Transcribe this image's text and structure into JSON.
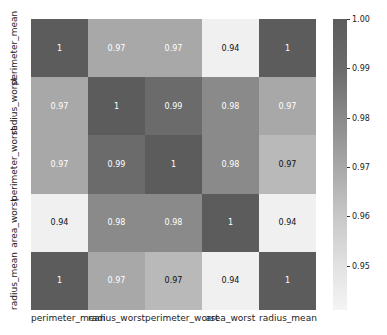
{
  "chart_data": {
    "type": "heatmap",
    "title": "",
    "xlabel": "",
    "ylabel": "",
    "x_labels": [
      "perimeter_mean",
      "radius_worst",
      "perimeter_worst",
      "area_worst",
      "radius_mean"
    ],
    "y_labels": [
      "perimeter_mean",
      "radius_worst",
      "perimeter_worst",
      "area_worst",
      "radius_mean"
    ],
    "matrix": [
      [
        1,
        0.97,
        0.97,
        0.94,
        1
      ],
      [
        0.97,
        1,
        0.99,
        0.98,
        0.97
      ],
      [
        0.97,
        0.99,
        1,
        0.98,
        0.97
      ],
      [
        0.94,
        0.98,
        0.98,
        1,
        0.94
      ],
      [
        1,
        0.97,
        0.97,
        0.94,
        1
      ]
    ],
    "annotations": [
      [
        "1",
        "0.97",
        "0.97",
        "0.94",
        "1"
      ],
      [
        "0.97",
        "1",
        "0.99",
        "0.98",
        "0.97"
      ],
      [
        "0.97",
        "0.99",
        "1",
        "0.98",
        "0.97"
      ],
      [
        "0.94",
        "0.98",
        "0.98",
        "1",
        "0.94"
      ],
      [
        "1",
        "0.97",
        "0.97",
        "0.94",
        "1"
      ]
    ],
    "cell_colors": [
      [
        "#5c5c5c",
        "#a8a8a8",
        "#a8a8a8",
        "#f0f0f0",
        "#5c5c5c"
      ],
      [
        "#a8a8a8",
        "#5c5c5c",
        "#6b6b6b",
        "#8a8a8a",
        "#a8a8a8"
      ],
      [
        "#a8a8a8",
        "#6b6b6b",
        "#5c5c5c",
        "#8a8a8a",
        "#b9b9b9"
      ],
      [
        "#f0f0f0",
        "#8a8a8a",
        "#8a8a8a",
        "#5c5c5c",
        "#f0f0f0"
      ],
      [
        "#5c5c5c",
        "#a8a8a8",
        "#b9b9b9",
        "#f0f0f0",
        "#5c5c5c"
      ]
    ],
    "text_colors": [
      [
        "#ffffff",
        "#ffffff",
        "#ffffff",
        "#111111",
        "#ffffff"
      ],
      [
        "#ffffff",
        "#ffffff",
        "#ffffff",
        "#ffffff",
        "#ffffff"
      ],
      [
        "#ffffff",
        "#ffffff",
        "#ffffff",
        "#ffffff",
        "#111111"
      ],
      [
        "#111111",
        "#ffffff",
        "#ffffff",
        "#ffffff",
        "#111111"
      ],
      [
        "#ffffff",
        "#ffffff",
        "#111111",
        "#111111",
        "#ffffff"
      ]
    ],
    "colorbar": {
      "ticks": [
        "1.00",
        "0.99",
        "0.98",
        "0.97",
        "0.96",
        "0.95"
      ],
      "tick_values": [
        1.0,
        0.99,
        0.98,
        0.97,
        0.96,
        0.95
      ],
      "range": [
        0.941,
        1.0
      ],
      "colormap": "greys"
    }
  }
}
